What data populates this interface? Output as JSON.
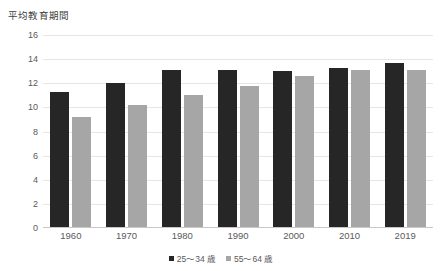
{
  "chart_data": {
    "type": "bar",
    "title": "平均教育期間",
    "xlabel": "",
    "ylabel": "",
    "ylim": [
      0,
      16
    ],
    "yticks": [
      "0",
      "2",
      "4",
      "6",
      "8",
      "10",
      "12",
      "14",
      "16"
    ],
    "ytick_values": [
      0,
      2,
      4,
      6,
      8,
      10,
      12,
      14,
      16
    ],
    "grid": true,
    "legend_position": "bottom-center",
    "categories": [
      "1960",
      "1970",
      "1980",
      "1990",
      "2000",
      "2010",
      "2019"
    ],
    "series": [
      {
        "name": "25～34 歳",
        "color": "#262626",
        "values": [
          11.3,
          12.0,
          13.1,
          13.1,
          13.0,
          13.3,
          13.7
        ]
      },
      {
        "name": "55～64 歳",
        "color": "#a6a6a6",
        "values": [
          9.2,
          10.2,
          11.0,
          11.8,
          12.6,
          13.1,
          13.1
        ]
      }
    ]
  },
  "colors": {
    "series_0": "#262626",
    "series_1": "#a6a6a6",
    "gridline": "#e6e6e6",
    "axis": "#c8c8c8",
    "text": "#5a5a5a",
    "background": "#ffffff"
  }
}
